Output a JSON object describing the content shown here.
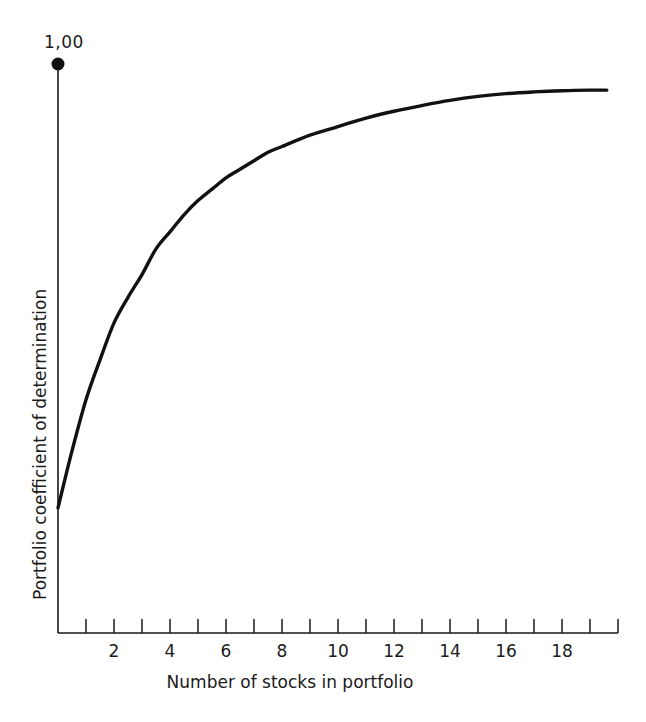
{
  "chart_data": {
    "type": "line",
    "title": "",
    "xlabel": "Number of stocks in portfolio",
    "ylabel": "Portfolio coefficient of determination",
    "xlim": [
      0,
      20
    ],
    "ylim": [
      0,
      1.0
    ],
    "grid": false,
    "legend": null,
    "y_axis_top_label": "1,00",
    "x_tick_labels": [
      "2",
      "4",
      "6",
      "8",
      "10",
      "12",
      "14",
      "16",
      "18"
    ],
    "x_tick_values": [
      2,
      4,
      6,
      8,
      10,
      12,
      14,
      16,
      18
    ],
    "x_minor_ticks": [
      1,
      2,
      3,
      4,
      5,
      6,
      7,
      8,
      9,
      10,
      11,
      12,
      13,
      14,
      15,
      16,
      17,
      18,
      19,
      20
    ],
    "series": [
      {
        "name": "Portfolio coefficient of determination",
        "x": [
          0,
          0.5,
          1,
          1.5,
          2,
          2.5,
          3,
          3.5,
          4,
          4.5,
          5,
          5.5,
          6,
          6.5,
          7,
          7.5,
          8,
          9,
          10,
          11,
          12,
          13,
          14,
          15,
          16,
          17,
          18,
          19,
          19.6
        ],
        "values": [
          0.22,
          0.32,
          0.41,
          0.48,
          0.545,
          0.59,
          0.63,
          0.675,
          0.705,
          0.735,
          0.76,
          0.78,
          0.8,
          0.815,
          0.83,
          0.845,
          0.855,
          0.875,
          0.89,
          0.905,
          0.917,
          0.927,
          0.936,
          0.943,
          0.948,
          0.951,
          0.953,
          0.954,
          0.954
        ]
      }
    ],
    "markers": [
      {
        "name": "y-axis-top-dot",
        "x": 0,
        "y": 1.0
      }
    ],
    "colors": {
      "curve": "#111111",
      "axis": "#1a1a1a",
      "background": "#ffffff"
    }
  }
}
